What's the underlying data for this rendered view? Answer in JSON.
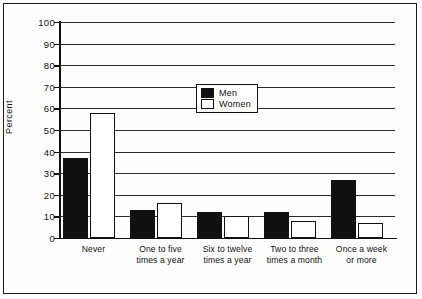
{
  "chart_data": {
    "type": "bar",
    "title": "",
    "xlabel": "",
    "ylabel": "Percent",
    "ylim": [
      0,
      100
    ],
    "ytick_step": 10,
    "yticks": [
      0,
      10,
      20,
      30,
      40,
      50,
      60,
      70,
      80,
      90,
      100
    ],
    "grid": true,
    "legend_position": "top-center",
    "categories": [
      "Never",
      "One to five\ntimes a year",
      "Six to twelve\ntimes a year",
      "Two to three\ntimes a month",
      "Once a week\nor more"
    ],
    "series": [
      {
        "name": "Men",
        "color": "#111111",
        "fill": "solid",
        "values": [
          37,
          13,
          12,
          12,
          27
        ]
      },
      {
        "name": "Women",
        "color": "#ffffff",
        "fill": "outline",
        "values": [
          58,
          16,
          10,
          8,
          7
        ]
      }
    ]
  },
  "legend": {
    "items": [
      {
        "label": "Men"
      },
      {
        "label": "Women"
      }
    ]
  },
  "colors": {
    "men_fill": "#111111",
    "women_fill": "#ffffff",
    "outline": "#111111",
    "background": "#ffffff"
  }
}
